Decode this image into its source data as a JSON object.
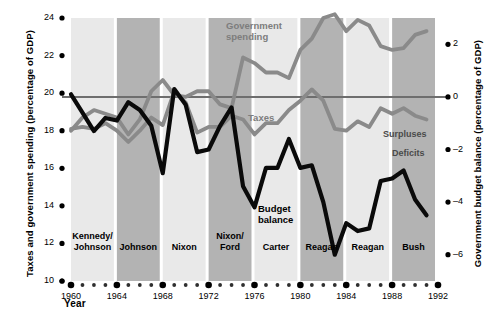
{
  "chart_data": {
    "type": "line",
    "title": "",
    "xlabel": "Year",
    "ylabel_left": "Taxes and government spending (percentage of GDP)",
    "ylabel_right": "Government budget balance (percentage of GDP)",
    "x": [
      1960,
      1961,
      1962,
      1963,
      1964,
      1965,
      1966,
      1967,
      1968,
      1969,
      1970,
      1971,
      1972,
      1973,
      1974,
      1975,
      1976,
      1977,
      1978,
      1979,
      1980,
      1981,
      1982,
      1983,
      1984,
      1985,
      1986,
      1987,
      1988,
      1989,
      1990,
      1991
    ],
    "xlim": [
      1960,
      1992
    ],
    "xticks_major": [
      1960,
      1964,
      1968,
      1972,
      1976,
      1980,
      1984,
      1988,
      1992
    ],
    "ylim_left": [
      10,
      24
    ],
    "yticks_left": [
      10,
      12,
      14,
      16,
      18,
      20,
      22,
      24
    ],
    "ylim_right": [
      -7,
      3
    ],
    "yticks_right": [
      2,
      0,
      -2,
      -4,
      -6
    ],
    "grid": false,
    "legend": "inline-annotations",
    "series": [
      {
        "name": "Government spending",
        "axis": "left",
        "color": "#8a8a8a",
        "values": [
          18.0,
          18.7,
          19.1,
          18.9,
          18.7,
          17.8,
          18.6,
          20.1,
          20.7,
          19.9,
          19.8,
          20.1,
          20.1,
          19.4,
          19.2,
          21.9,
          21.6,
          21.1,
          21.1,
          20.8,
          22.3,
          22.9,
          24.0,
          24.2,
          23.3,
          23.9,
          23.6,
          22.5,
          22.3,
          22.4,
          23.1,
          23.3
        ]
      },
      {
        "name": "Taxes",
        "axis": "left",
        "color": "#8a8a8a",
        "values": [
          18.1,
          18.2,
          18.1,
          18.4,
          18.0,
          17.4,
          18.0,
          18.7,
          18.3,
          20.1,
          19.5,
          17.9,
          18.2,
          18.2,
          18.8,
          18.6,
          17.8,
          18.4,
          18.4,
          19.1,
          19.6,
          20.2,
          19.6,
          18.1,
          18.0,
          18.5,
          18.2,
          19.2,
          18.9,
          19.2,
          18.8,
          18.6
        ]
      },
      {
        "name": "Budget balance",
        "axis": "right",
        "color": "#0a0a0a",
        "values": [
          0.1,
          -0.6,
          -1.3,
          -0.8,
          -0.9,
          -0.2,
          -0.5,
          -1.1,
          -2.9,
          0.3,
          -0.3,
          -2.1,
          -2.0,
          -1.1,
          -0.4,
          -3.4,
          -4.2,
          -2.7,
          -2.7,
          -1.6,
          -2.7,
          -2.6,
          -4.0,
          -6.0,
          -4.8,
          -5.1,
          -5.0,
          -3.2,
          -3.1,
          -2.8,
          -3.9,
          -4.5
        ]
      }
    ],
    "annotations": [
      {
        "name": "government-spending-label",
        "text": "Government\nspending",
        "color": "#7d7d7d"
      },
      {
        "name": "taxes-label",
        "text": "Taxes",
        "color": "#7d7d7d"
      },
      {
        "name": "budget-balance-label",
        "text": "Budget\nbalance",
        "color": "#000000"
      },
      {
        "name": "surpluses-label",
        "text": "Surpluses",
        "color": "#4a4a4a"
      },
      {
        "name": "deficits-label",
        "text": "Deficits",
        "color": "#4a4a4a"
      }
    ],
    "president_bands": [
      {
        "label": "Kennedy/\nJohnson",
        "start": 1960,
        "end": 1964,
        "shade": "light"
      },
      {
        "label": "Johnson",
        "start": 1964,
        "end": 1968,
        "shade": "dark"
      },
      {
        "label": "Nixon",
        "start": 1968,
        "end": 1972,
        "shade": "light"
      },
      {
        "label": "Nixon/\nFord",
        "start": 1972,
        "end": 1976,
        "shade": "dark"
      },
      {
        "label": "Carter",
        "start": 1976,
        "end": 1980,
        "shade": "light"
      },
      {
        "label": "Reagan",
        "start": 1980,
        "end": 1984,
        "shade": "dark"
      },
      {
        "label": "Reagan",
        "start": 1984,
        "end": 1988,
        "shade": "light"
      },
      {
        "label": "Bush",
        "start": 1988,
        "end": 1992,
        "shade": "dark"
      }
    ]
  },
  "axes": {
    "left": {
      "title": "Taxes and government spending (percentage of GDP)",
      "ticks": [
        "24",
        "22",
        "20",
        "18",
        "16",
        "14",
        "12",
        "10"
      ]
    },
    "right": {
      "title": "Government budget balance (percentage of GDP)",
      "ticks": [
        "2",
        "0",
        "–2",
        "–4",
        "–6"
      ]
    },
    "x": {
      "title": "Year",
      "ticks": [
        "1960",
        "1964",
        "1968",
        "1972",
        "1976",
        "1980",
        "1984",
        "1988",
        "1992"
      ]
    }
  },
  "labels": {
    "government_spending_line1": "Government",
    "government_spending_line2": "spending",
    "taxes": "Taxes",
    "budget_balance_line1": "Budget",
    "budget_balance_line2": "balance",
    "surpluses": "Surpluses",
    "deficits": "Deficits"
  },
  "presidents": {
    "p1_line1": "Kennedy/",
    "p1_line2": "Johnson",
    "p2": "Johnson",
    "p3": "Nixon",
    "p4_line1": "Nixon/",
    "p4_line2": "Ford",
    "p5": "Carter",
    "p6": "Reagan",
    "p7": "Reagan",
    "p8": "Bush"
  },
  "colors": {
    "band_light": "#e9e9e9",
    "band_dark": "#b3b3b3",
    "gray_line": "#8a8a8a",
    "black_line": "#0d0d0d",
    "zero_line": "#6e6e6e"
  }
}
